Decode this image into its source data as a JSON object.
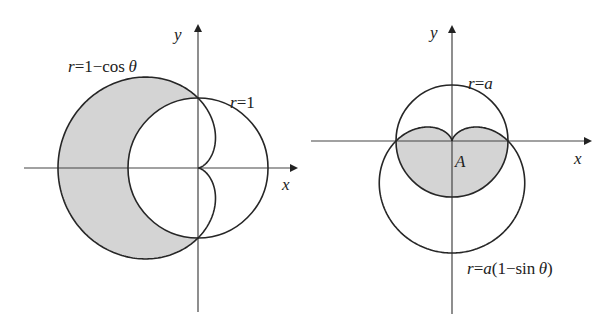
{
  "figures": [
    {
      "id": "left",
      "axis_x_label": "x",
      "axis_y_label": "y",
      "curves": [
        {
          "label_r": "r",
          "label_eq": "=1−cos ",
          "label_theta": "θ",
          "equation": "r=1−cosθ",
          "type": "cardioid"
        },
        {
          "label_r": "r",
          "label_eq": "=1",
          "equation": "r=1",
          "type": "circle"
        }
      ],
      "shaded_region": "inside r=1−cosθ, outside r=1",
      "fill_color": "#d4d4d4"
    },
    {
      "id": "right",
      "axis_x_label": "x",
      "axis_y_label": "y",
      "region_label": "A",
      "curves": [
        {
          "label_r": "r",
          "label_eq": "=",
          "label_a": "a",
          "equation": "r=a",
          "type": "circle"
        },
        {
          "label_r": "r",
          "label_eq": "=",
          "label_a": "a",
          "label_rest": "(1−sin ",
          "label_theta": "θ",
          "label_close": ")",
          "equation": "r=a(1−sinθ)",
          "type": "cardioid"
        }
      ],
      "shaded_region": "inside both r=a and r=a(1−sinθ)",
      "fill_color": "#d4d4d4"
    }
  ],
  "colors": {
    "stroke": "#262626",
    "axis": "#444444",
    "fill": "#d4d4d4"
  }
}
